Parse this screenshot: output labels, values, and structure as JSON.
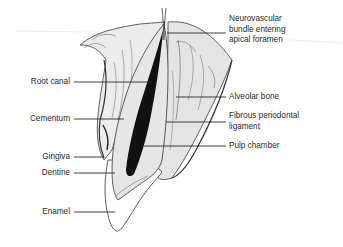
{
  "diagram": {
    "labels_left": [
      {
        "id": "root-canal",
        "text": "Root canal"
      },
      {
        "id": "cementum",
        "text": "Cementum"
      },
      {
        "id": "gingiva",
        "text": "Gingiva"
      },
      {
        "id": "dentine",
        "text": "Dentine"
      },
      {
        "id": "enamel",
        "text": "Enamel"
      }
    ],
    "labels_right": [
      {
        "id": "neurovascular-bundle",
        "lines": [
          "Neurovascular",
          "bundle entering",
          "apical foramen"
        ]
      },
      {
        "id": "alveolar-bone",
        "text": "Alveolar bone"
      },
      {
        "id": "fibrous-periodontal-ligament",
        "lines": [
          "Fibrous periodontal",
          "ligament"
        ]
      },
      {
        "id": "pulp-chamber",
        "text": "Pulp chamber"
      }
    ],
    "colors": {
      "line": "#2a2a2a",
      "pulp": "#111111",
      "dentine": "#e6e6e6",
      "enamel": "#ffffff",
      "bone": "#d9d9d9",
      "background": "#ffffff"
    }
  }
}
